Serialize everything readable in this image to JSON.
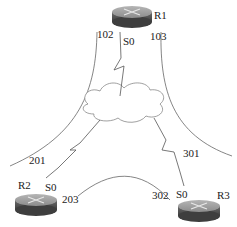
{
  "routers": [
    {
      "name": "R1",
      "interface": "S0"
    },
    {
      "name": "R2",
      "interface": "S0"
    },
    {
      "name": "R3",
      "interface": "S0"
    }
  ],
  "labels": {
    "l102": "102",
    "l103": "103",
    "l201": "201",
    "l203": "203",
    "l301": "301",
    "l302": "302"
  },
  "cloud": {
    "name": "frame-relay-cloud"
  },
  "colors": {
    "line": "#555555",
    "router_top": "#9a9a9a",
    "router_side": "#555555"
  }
}
